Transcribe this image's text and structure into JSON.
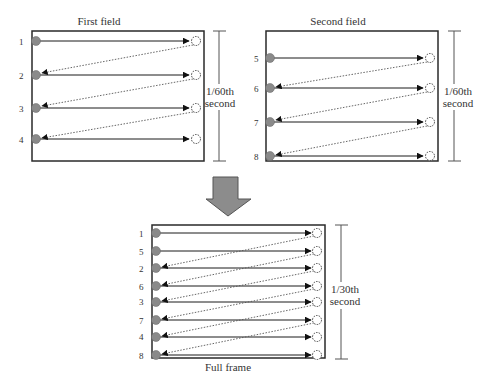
{
  "colors": {
    "frame": "#2a2a2a",
    "scanline": "#1a1a1a",
    "retrace": "#555555",
    "dot": "#8a8a8a",
    "arrow_fill": "#8c8c8c",
    "text": "#333333"
  },
  "panels": {
    "first": {
      "title": "First field",
      "duration_label_line1": "1/60th",
      "duration_label_line2": "second",
      "line_labels": [
        "1",
        "2",
        "3",
        "4"
      ]
    },
    "second": {
      "title": "Second field",
      "duration_label_line1": "1/60th",
      "duration_label_line2": "second",
      "line_labels": [
        "5",
        "6",
        "7",
        "8"
      ]
    },
    "full": {
      "title": "Full frame",
      "duration_label_line1": "1/30th",
      "duration_label_line2": "second",
      "line_labels": [
        "1",
        "5",
        "2",
        "6",
        "3",
        "7",
        "4",
        "8"
      ]
    }
  },
  "combine_arrow": "down-arrow"
}
